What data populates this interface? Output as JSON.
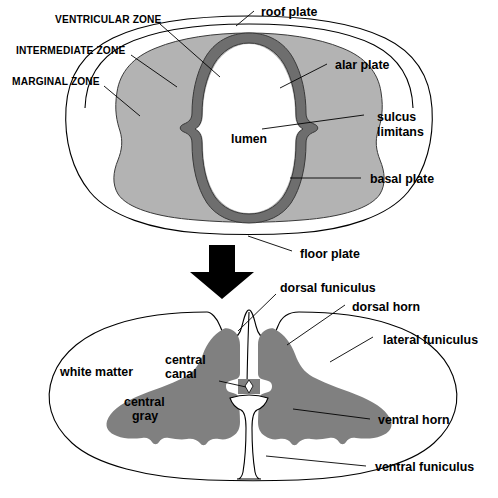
{
  "figure": {
    "colors": {
      "background": "#ffffff",
      "outline": "#000000",
      "intermediate_zone_gray": "#b3b3b3",
      "ventricular_zone_gray": "#6e6e6e",
      "central_gray": "#808080",
      "arrow": "#000000",
      "text": "#000000"
    }
  },
  "top_panel": {
    "name": "embryonic-neural-tube",
    "labels": {
      "ventricular_zone": "VENTRICULAR ZONE",
      "intermediate_zone": "INTERMEDIATE ZONE",
      "marginal_zone": "MARGINAL ZONE",
      "roof_plate": "roof plate",
      "alar_plate": "alar plate",
      "sulcus_limitans_line1": "sulcus",
      "sulcus_limitans_line2": "limitans",
      "basal_plate": "basal plate",
      "floor_plate": "floor plate",
      "lumen": "lumen"
    }
  },
  "transition": {
    "name": "down-arrow",
    "icon": "down-arrow-icon"
  },
  "bottom_panel": {
    "name": "mature-spinal-cord",
    "labels": {
      "dorsal_funiculus": "dorsal funiculus",
      "dorsal_horn": "dorsal horn",
      "lateral_funiculus": "lateral funiculus",
      "ventral_horn": "ventral horn",
      "ventral_funiculus": "ventral funiculus",
      "white_matter": "white matter",
      "central_canal_line1": "central",
      "central_canal_line2": "canal",
      "central_gray_line1": "central",
      "central_gray_line2": "gray"
    }
  }
}
